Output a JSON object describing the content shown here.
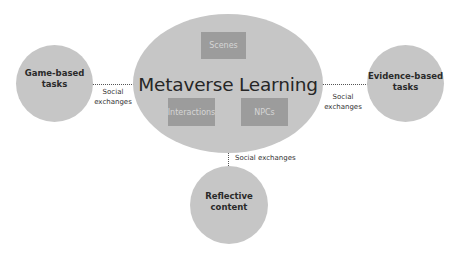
{
  "diagram": {
    "hub": {
      "title": "Metaverse Learning",
      "components": [
        {
          "label": "Scenes"
        },
        {
          "label": "Interactions"
        },
        {
          "label": "NPCs"
        }
      ]
    },
    "nodes": {
      "left": {
        "line1": "Game-based",
        "line2": "tasks"
      },
      "right": {
        "line1": "Evidence-based",
        "line2": "tasks"
      },
      "bottom": {
        "line1": "Reflective",
        "line2": "content"
      }
    },
    "edges": {
      "left": {
        "line1": "Social",
        "line2": "exchanges"
      },
      "right": {
        "line1": "Social",
        "line2": "exchanges"
      },
      "bottom": {
        "label": "Social exchanges"
      }
    },
    "colors": {
      "node_fill": "#c6c6c6",
      "box_fill": "#9c9c9c",
      "box_text": "#d6d6d6",
      "text": "#262626",
      "connector": "#555555"
    }
  }
}
